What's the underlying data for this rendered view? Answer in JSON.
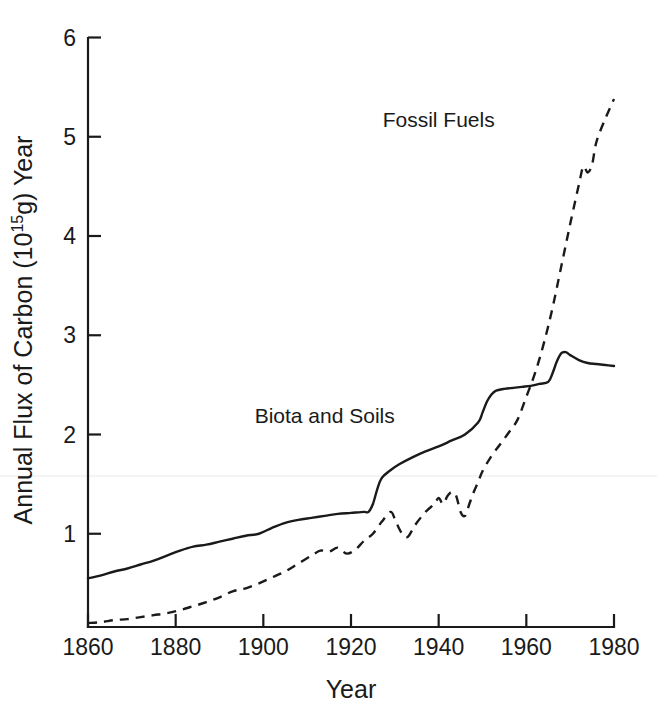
{
  "chart_data": {
    "type": "line",
    "title": "",
    "xlabel": "Year",
    "ylabel": "Annual Flux of Carbon (10",
    "ylabel_sup": "15",
    "ylabel_tail": "g) Year",
    "xlim": [
      1860,
      1980
    ],
    "ylim": [
      0,
      6
    ],
    "grid": false,
    "legend_position": "inline-annotations",
    "xticks": [
      1860,
      1880,
      1900,
      1920,
      1940,
      1960,
      1980
    ],
    "xtick_labels": [
      "1860",
      "1880",
      "1900",
      "1920",
      "1940",
      "1960",
      "1980"
    ],
    "yticks": [
      1,
      2,
      3,
      4,
      5,
      6
    ],
    "ytick_labels": [
      "1",
      "2",
      "3",
      "4",
      "5",
      "6"
    ],
    "annotations": [
      {
        "text": "Fossil Fuels",
        "x": 1940,
        "y": 5.1
      },
      {
        "text": "Biota and Soils",
        "x": 1914,
        "y": 2.12
      }
    ],
    "series": [
      {
        "name": "Biota and Soils",
        "style": "solid",
        "x": [
          1860,
          1863,
          1866,
          1869,
          1872,
          1875,
          1878,
          1881,
          1884,
          1887,
          1890,
          1893,
          1896,
          1899,
          1902,
          1905,
          1908,
          1911,
          1914,
          1917,
          1920,
          1923,
          1924,
          1925,
          1926,
          1927,
          1929,
          1931,
          1934,
          1937,
          1940,
          1943,
          1946,
          1949,
          1950,
          1951,
          1952,
          1953,
          1955,
          1957,
          1959,
          1961,
          1963,
          1965,
          1966,
          1967,
          1968,
          1969,
          1970,
          1972,
          1974,
          1976,
          1978,
          1980
        ],
        "values": [
          0.55,
          0.58,
          0.62,
          0.65,
          0.69,
          0.73,
          0.78,
          0.83,
          0.87,
          0.89,
          0.92,
          0.95,
          0.98,
          1.0,
          1.06,
          1.11,
          1.14,
          1.16,
          1.18,
          1.2,
          1.21,
          1.22,
          1.22,
          1.3,
          1.45,
          1.56,
          1.64,
          1.7,
          1.77,
          1.83,
          1.88,
          1.94,
          2.0,
          2.12,
          2.22,
          2.33,
          2.4,
          2.44,
          2.46,
          2.47,
          2.48,
          2.49,
          2.51,
          2.53,
          2.62,
          2.74,
          2.82,
          2.83,
          2.8,
          2.75,
          2.72,
          2.71,
          2.7,
          2.69
        ]
      },
      {
        "name": "Fossil Fuels",
        "style": "dashed",
        "x": [
          1860,
          1863,
          1866,
          1869,
          1872,
          1875,
          1878,
          1881,
          1884,
          1887,
          1890,
          1893,
          1896,
          1899,
          1902,
          1905,
          1908,
          1911,
          1913,
          1915,
          1917,
          1919,
          1921,
          1923,
          1925,
          1927,
          1929,
          1930,
          1931,
          1932,
          1933,
          1934,
          1935,
          1937,
          1939,
          1940,
          1941,
          1942,
          1943,
          1944,
          1945,
          1946,
          1947,
          1948,
          1949,
          1950,
          1952,
          1954,
          1956,
          1958,
          1960,
          1962,
          1964,
          1966,
          1968,
          1970,
          1972,
          1973,
          1974,
          1975,
          1976,
          1978,
          1980
        ],
        "values": [
          0.1,
          0.11,
          0.13,
          0.14,
          0.16,
          0.18,
          0.2,
          0.23,
          0.27,
          0.31,
          0.36,
          0.42,
          0.45,
          0.5,
          0.56,
          0.62,
          0.7,
          0.78,
          0.83,
          0.82,
          0.86,
          0.8,
          0.84,
          0.93,
          1.0,
          1.12,
          1.22,
          1.15,
          1.05,
          0.98,
          0.97,
          1.04,
          1.11,
          1.22,
          1.3,
          1.36,
          1.3,
          1.38,
          1.42,
          1.38,
          1.22,
          1.18,
          1.3,
          1.42,
          1.52,
          1.63,
          1.78,
          1.9,
          2.02,
          2.15,
          2.38,
          2.62,
          2.92,
          3.28,
          3.7,
          4.12,
          4.52,
          4.7,
          4.64,
          4.72,
          4.95,
          5.18,
          5.38
        ]
      }
    ]
  },
  "geometry": {
    "plot_left": 88,
    "plot_right": 614,
    "plot_bottom": 627,
    "plot_top": 38,
    "y_zero_px": 633,
    "px_per_unit": 99.25
  }
}
